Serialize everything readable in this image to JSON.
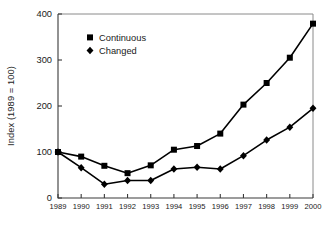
{
  "chart_data": {
    "type": "line",
    "title": "",
    "xlabel": "",
    "ylabel": "Index (1989 = 100)",
    "categories": [
      "1989",
      "1990",
      "1991",
      "1992",
      "1993",
      "1994",
      "1995",
      "1996",
      "1997",
      "1998",
      "1999",
      "2000"
    ],
    "ylim": [
      0,
      400
    ],
    "yticks": [
      0,
      100,
      200,
      300,
      400
    ],
    "grid": false,
    "legend_position": "top-left-inside",
    "series": [
      {
        "name": "Continuous",
        "marker": "square",
        "color": "#000000",
        "values": [
          100,
          90,
          70,
          54,
          71,
          105,
          113,
          140,
          203,
          250,
          305,
          379
        ]
      },
      {
        "name": "Changed",
        "marker": "diamond",
        "color": "#000000",
        "values": [
          100,
          66,
          30,
          38,
          38,
          63,
          67,
          63,
          92,
          126,
          154,
          195
        ]
      }
    ]
  },
  "axis": {
    "y_tick_labels": [
      "400",
      "300",
      "200",
      "100",
      "0"
    ],
    "y_axis_title": "Index (1989 = 100)",
    "x_tick_labels": [
      "1989",
      "1990",
      "1991",
      "1992",
      "1993",
      "1994",
      "1995",
      "1996",
      "1997",
      "1998",
      "1999",
      "2000"
    ]
  },
  "legend": {
    "items": [
      {
        "label": "Continuous",
        "marker": "square-marker-icon"
      },
      {
        "label": "Changed",
        "marker": "diamond-marker-icon"
      }
    ]
  }
}
